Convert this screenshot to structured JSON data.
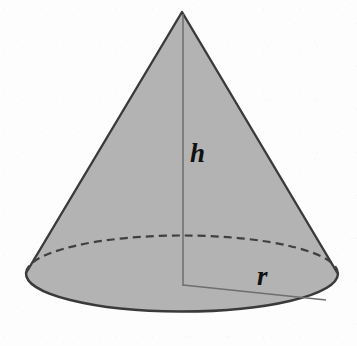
{
  "figure": {
    "shape": "cone",
    "background_color": "#fdfdfd",
    "fill_color": "#b3b3b3",
    "outline_color": "#3a3a3a",
    "dashed_color": "#404040",
    "thin_line_color": "#6e6e6e",
    "label_color": "#111111"
  },
  "labels": {
    "height": "h",
    "radius": "r"
  },
  "geometry": {
    "apex": {
      "x": 182,
      "y": 12
    },
    "base_center": {
      "x": 183,
      "y": 285
    },
    "base_left": {
      "x": 26,
      "y": 273
    },
    "base_right": {
      "x": 338,
      "y": 274
    },
    "base_bottom": {
      "x": 183,
      "y": 312
    },
    "ellipse_rx": 156,
    "ellipse_ry": 38,
    "radius_endpoint": {
      "x": 326,
      "y": 300
    },
    "dash_pattern": "8 5",
    "outline_width": 2.4,
    "thin_line_width": 1.4
  }
}
